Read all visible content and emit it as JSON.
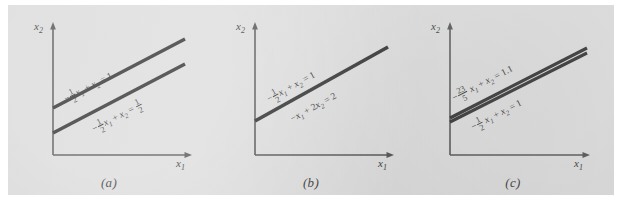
{
  "figure": {
    "background_color": "#d9d9d9",
    "line_color": "#111111",
    "axis_color": "#3a3a3a"
  },
  "axes": {
    "x_label": "x",
    "x_sub": "1",
    "y_label": "x",
    "y_sub": "2"
  },
  "panels": [
    {
      "caption": "(a)",
      "case": "inconsistent-parallel-lines",
      "labels": [
        {
          "name": "equation-upper",
          "sign": "−",
          "frac_num": "1",
          "frac_den": "2",
          "var1": "x",
          "var1_sub": "1",
          "plus": "+",
          "var2": "x",
          "var2_sub": "2",
          "equals": "=",
          "rhs": "1",
          "rhs_num": null,
          "rhs_den": null,
          "text": "− 1/2 x₁ + x₂ = 1"
        },
        {
          "name": "equation-lower",
          "sign": "−",
          "frac_num": "1",
          "frac_den": "2",
          "var1": "x",
          "var1_sub": "1",
          "plus": "+",
          "var2": "x",
          "var2_sub": "2",
          "equals": "=",
          "rhs": null,
          "rhs_num": "1",
          "rhs_den": "2",
          "text": "− 1/2 x₁ + x₂ = 1/2"
        }
      ]
    },
    {
      "caption": "(b)",
      "case": "dependent-identical-lines",
      "labels": [
        {
          "name": "equation-upper",
          "sign": "−",
          "frac_num": "1",
          "frac_den": "2",
          "var1": "x",
          "var1_sub": "1",
          "plus": "+",
          "var2": "x",
          "var2_sub": "2",
          "equals": "=",
          "rhs": "1",
          "rhs_num": null,
          "rhs_den": null,
          "text": "− 1/2 x₁ + x₂ = 1"
        },
        {
          "name": "equation-lower",
          "sign": "−",
          "frac_num": null,
          "frac_den": null,
          "var1": "x",
          "var1_sub": "1",
          "plus": "+",
          "coef2": "2",
          "var2": "x",
          "var2_sub": "2",
          "equals": "=",
          "rhs": "2",
          "text": "−x₁ + 2x₂ = 2"
        }
      ]
    },
    {
      "caption": "(c)",
      "case": "nearly-dependent-ill-conditioned",
      "labels": [
        {
          "name": "equation-upper",
          "sign": "−",
          "frac_num": "23",
          "frac_den": "5",
          "var1": "x",
          "var1_sub": "1",
          "plus": "+",
          "var2": "x",
          "var2_sub": "2",
          "equals": "=",
          "rhs": "1.1",
          "text": "− 23/5 x₁ + x₂ = 1.1"
        },
        {
          "name": "equation-lower",
          "sign": "−",
          "frac_num": "1",
          "frac_den": "2",
          "var1": "x",
          "var1_sub": "1",
          "plus": "+",
          "var2": "x",
          "var2_sub": "2",
          "equals": "=",
          "rhs": "1",
          "text": "− 1/2 x₁ + x₂ = 1"
        }
      ]
    }
  ]
}
